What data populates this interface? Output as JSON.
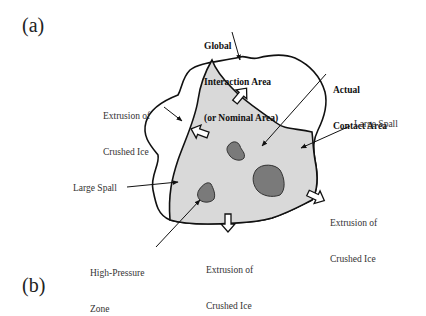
{
  "panels": {
    "a": "(a)",
    "b": "(b)"
  },
  "labels": {
    "global_area_line1": "Global",
    "global_area_line2": "Interaction Area",
    "global_area_line3": "(or Nominal Area)",
    "actual_contact_line1": "Actual",
    "actual_contact_line2": "Contact Area",
    "extrusion_topleft_line1": "Extrusion of",
    "extrusion_topleft_line2": "Crushed Ice",
    "large_spall_right": "Large Spall",
    "large_spall_left": "Large Spall",
    "extrusion_right_line1": "Extrusion of",
    "extrusion_right_line2": "Crushed Ice",
    "extrusion_bottom_line1": "Extrusion of",
    "extrusion_bottom_line2": "Crushed Ice",
    "high_pressure_line1": "High-Pressure",
    "high_pressure_line2": "Zone"
  },
  "colors": {
    "outline": "#111111",
    "contact_fill": "#d9d9d9",
    "high_pressure_fill": "#7a7a7a"
  }
}
